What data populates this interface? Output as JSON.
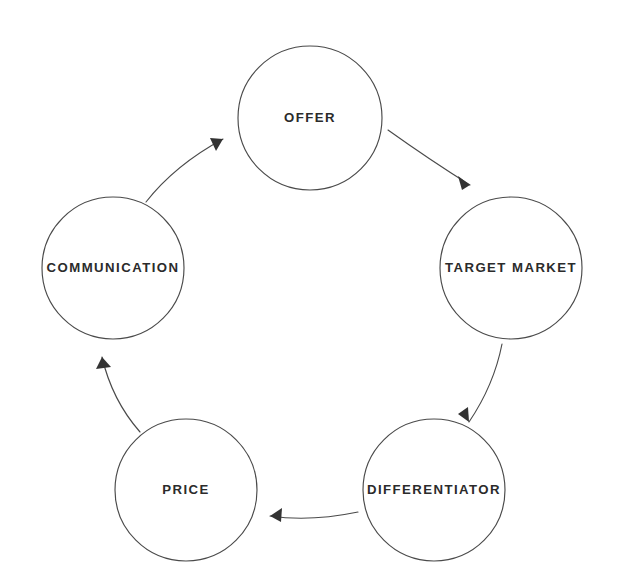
{
  "diagram": {
    "type": "cycle",
    "background_color": "#ffffff",
    "stroke_color": "#4a4a4a",
    "text_color": "#2b2b2b",
    "arrow_color": "#333333",
    "direction": "clockwise",
    "nodes": [
      {
        "id": "offer",
        "label": "OFFER",
        "cx": 310,
        "cy": 118,
        "r": 72,
        "position": "top"
      },
      {
        "id": "target-market",
        "label": "TARGET MARKET",
        "cx": 511,
        "cy": 268,
        "r": 71,
        "position": "right"
      },
      {
        "id": "differentiator",
        "label": "DIFFERENTIATOR",
        "cx": 434,
        "cy": 490,
        "r": 71,
        "position": "bottom-right"
      },
      {
        "id": "price",
        "label": "PRICE",
        "cx": 186,
        "cy": 490,
        "r": 71,
        "position": "bottom-left"
      },
      {
        "id": "communication",
        "label": "COMMUNICATION",
        "cx": 113,
        "cy": 268,
        "r": 71,
        "position": "left"
      }
    ],
    "connectors": [
      {
        "id": "offer-to-target-market",
        "from": "offer",
        "to": "target-market",
        "path": "M 388 130 Q 430 160 470 185",
        "head": "470,185 458,176 462,190"
      },
      {
        "id": "target-market-to-differentiator",
        "from": "target-market",
        "to": "differentiator",
        "path": "M 502 344 Q 494 385 469 422",
        "head": "469,422 468,407 458,414"
      },
      {
        "id": "differentiator-to-price",
        "from": "differentiator",
        "to": "price",
        "path": "M 358 512 Q 310 522 270 516",
        "head": "270,516 282,508 281,522"
      },
      {
        "id": "price-to-communication",
        "from": "price",
        "to": "communication",
        "path": "M 140 432 Q 112 400 102 357",
        "head": "102,357 111,367 96,369"
      },
      {
        "id": "communication-to-offer",
        "from": "communication",
        "to": "offer",
        "path": "M 146 202 Q 175 165 223 139",
        "head": "223,139 210,138 216,151"
      }
    ]
  }
}
